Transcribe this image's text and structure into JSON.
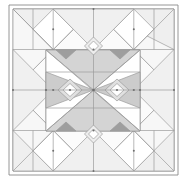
{
  "figure": {
    "background_color": "#ffffff",
    "canvas": {
      "width": 186,
      "height": 185
    }
  },
  "palette": {
    "white": "#ffffff",
    "very_light_gray": "#f2f2f2",
    "light_gray": "#e9e9e9",
    "mid_light_gray": "#dedede",
    "mid_gray": "#cfcfcf",
    "gray": "#c2c2c2",
    "dark_gray": "#a8a8a8",
    "darkest_gray": "#9a9a9a",
    "line_color": "#8a8a8a",
    "line_color_thin": "#9b9b9b"
  },
  "geometry": {
    "outer_frame": {
      "x": 9,
      "y": 5,
      "width": 169,
      "height": 170
    },
    "outer_frame_inset": {
      "x": 13,
      "y": 9,
      "width": 161,
      "height": 162
    },
    "inner_square": {
      "x": 46,
      "y": 50,
      "width": 94,
      "height": 81
    },
    "center": {
      "x": 93.5,
      "y": 90
    },
    "eye_left_center": {
      "x": 70,
      "y": 90
    },
    "eye_right_center": {
      "x": 117,
      "y": 90
    },
    "eye_diamond_radius_x": 11,
    "eye_diamond_radius_y": 10,
    "eye_hole_radius_x": 6,
    "eye_hole_radius_y": 5.5,
    "top_diamond_center": {
      "x": 93.5,
      "y": 46
    },
    "bottom_diamond_center": {
      "x": 93.5,
      "y": 134
    },
    "small_diamond_radius": 9
  },
  "elements": {
    "outer_border_label": "outer-border",
    "inner_border_label": "inner-border",
    "center_block_label": "center-block",
    "left_eye_label": "left-eye-motif",
    "right_eye_label": "right-eye-motif",
    "top_diamond_label": "top-diamond",
    "bottom_diamond_label": "bottom-diamond"
  }
}
